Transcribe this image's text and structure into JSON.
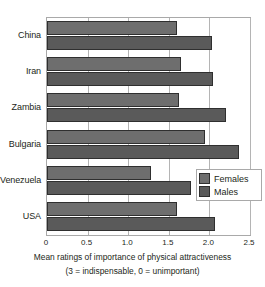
{
  "chart_data": {
    "type": "bar",
    "orientation": "horizontal",
    "title": "",
    "xlabel": "Mean ratings of importance of physical attractiveness",
    "xlabel_note": "(3 = indispensable, 0 = unimportant)",
    "ylabel": "",
    "categories": [
      "China",
      "Iran",
      "Zambia",
      "Bulgaria",
      "Venezuela",
      "USA"
    ],
    "series": [
      {
        "name": "Females",
        "color": "#6e6e6e",
        "values": [
          1.6,
          1.65,
          1.62,
          1.95,
          1.28,
          1.6
        ]
      },
      {
        "name": "Males",
        "color": "#5a5a5a",
        "values": [
          2.03,
          2.05,
          2.2,
          2.37,
          1.77,
          2.07
        ]
      }
    ],
    "xlim": [
      0,
      2.5
    ],
    "xticks": [
      0,
      0.5,
      1.0,
      1.5,
      2.0,
      2.5
    ],
    "xtick_labels": [
      "0",
      "0.5",
      "1.0",
      "1.5",
      "2.0",
      "2.5"
    ],
    "grid": true,
    "grid_axis": "x",
    "legend_position": "inside-right"
  },
  "axis": {
    "caption_line_1": "Mean ratings of importance of physical attractiveness",
    "caption_line_2": "(3 = indispensable, 0 = unimportant)"
  },
  "legend": {
    "items": [
      {
        "label": "Females"
      },
      {
        "label": "Males"
      }
    ]
  },
  "colors": {
    "females": "#6e6e6e",
    "males": "#5a5a5a",
    "grid": "#b4b4b4",
    "frame": "#a9a9a9",
    "text": "#231f20",
    "background": "#ffffff"
  }
}
